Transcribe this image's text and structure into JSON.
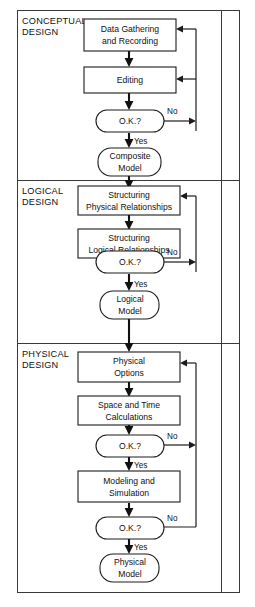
{
  "diagram": {
    "colors": {
      "background": "#ffffff",
      "frame": "#3a3a3a",
      "box_stroke": "#1c1c1c",
      "flow_line": "#111111",
      "text": "#111111"
    },
    "sections": [
      {
        "id": "conceptual",
        "line1": "CONCEPTUAL",
        "line2": "DESIGN"
      },
      {
        "id": "logical",
        "line1": "LOGICAL",
        "line2": "DESIGN"
      },
      {
        "id": "physical",
        "line1": "PHYSICAL",
        "line2": "DESIGN"
      }
    ],
    "nodes": [
      {
        "id": "data-gathering",
        "shape": "process",
        "line1": "Data Gathering",
        "line2": "and Recording"
      },
      {
        "id": "editing",
        "shape": "process",
        "line1": "Editing",
        "line2": ""
      },
      {
        "id": "ok-1",
        "shape": "decision",
        "line1": "O.K.?",
        "line2": ""
      },
      {
        "id": "composite-model",
        "shape": "terminator",
        "line1": "Composite",
        "line2": "Model"
      },
      {
        "id": "structuring-physical",
        "shape": "process",
        "line1": "Structuring",
        "line2": "Physical Relationships"
      },
      {
        "id": "structuring-logical",
        "shape": "process",
        "line1": "Structuring",
        "line2": "Logical Relationships"
      },
      {
        "id": "ok-2",
        "shape": "decision",
        "line1": "O.K.?",
        "line2": ""
      },
      {
        "id": "logical-model",
        "shape": "terminator",
        "line1": "Logical",
        "line2": "Model"
      },
      {
        "id": "physical-options",
        "shape": "process",
        "line1": "Physical",
        "line2": "Options"
      },
      {
        "id": "space-time",
        "shape": "process",
        "line1": "Space and Time",
        "line2": "Calculations"
      },
      {
        "id": "ok-3",
        "shape": "decision",
        "line1": "O.K.?",
        "line2": ""
      },
      {
        "id": "modeling-simulation",
        "shape": "process",
        "line1": "Modeling and",
        "line2": "Simulation"
      },
      {
        "id": "ok-4",
        "shape": "decision",
        "line1": "O.K.?",
        "line2": ""
      },
      {
        "id": "physical-model",
        "shape": "terminator",
        "line1": "Physical",
        "line2": "Model"
      }
    ],
    "edge_labels": {
      "no_1": "No",
      "yes_1": "Yes",
      "no_2": "No",
      "yes_2": "Yes",
      "no_3": "No",
      "yes_3": "Yes",
      "no_4": "No",
      "yes_4": "Yes"
    }
  }
}
